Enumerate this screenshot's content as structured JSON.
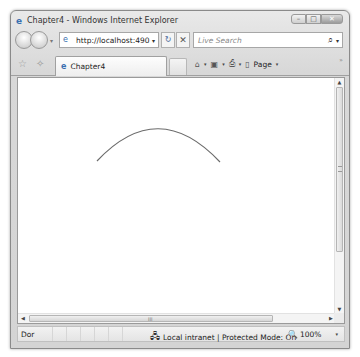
{
  "window": {
    "title": "Chapter4 - Windows Internet Explorer",
    "caption_buttons": {
      "minimize": "–",
      "maximize": "□",
      "close": "✕"
    }
  },
  "navigation": {
    "back_icon": "◀",
    "forward_icon": "▶",
    "dropdown_icon": "▾",
    "address_url": "http://localhost:4901!",
    "address_dropdown_icon": "▾",
    "refresh_icon": "↻",
    "stop_icon": "✕",
    "search_placeholder": "Live Search",
    "search_icon": "⌕",
    "search_dropdown_icon": "▾"
  },
  "tabbar": {
    "favorites_icon": "☆",
    "add_favorites_icon": "✧",
    "tabs": [
      {
        "label": "Chapter4",
        "icon": "e"
      }
    ],
    "commands": {
      "home_icon": "⌂",
      "feeds_icon": "▣",
      "print_icon": "⎙",
      "page_icon": "▯",
      "page_label": "Page",
      "dropdown_icon": "▾",
      "more_icon": "»"
    }
  },
  "content": {
    "shape": "arc",
    "arc": {
      "start": [
        79,
        83
      ],
      "control": [
        140,
        18
      ],
      "end": [
        202,
        84
      ],
      "stroke": "#6b6b6b"
    }
  },
  "scrollbars": {
    "vertical": {
      "up_icon": "▲",
      "down_icon": "▼"
    },
    "horizontal": {
      "left_icon": "◀",
      "right_icon": "▶",
      "grip": "III"
    }
  },
  "statusbar": {
    "text": "Dor",
    "zone_icon": "🖧",
    "zone_label": "Local intranet | Protected Mode: On",
    "zoom_icon": "🔍",
    "zoom_level": "100%",
    "zoom_dropdown_icon": "▾"
  }
}
